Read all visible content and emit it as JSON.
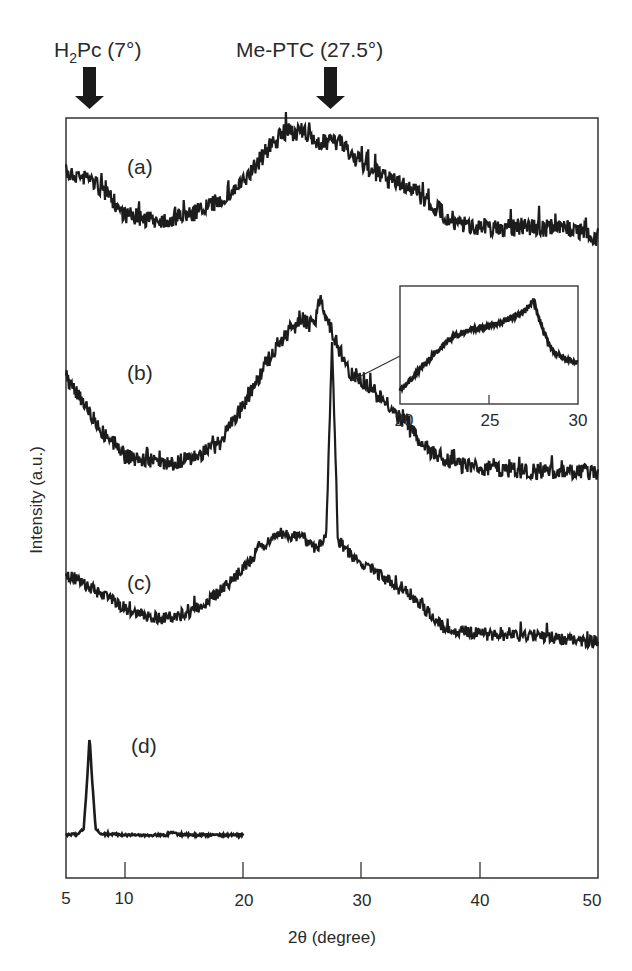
{
  "chart_data": {
    "type": "line",
    "title": "",
    "xlabel": "2θ (degree)",
    "ylabel": "Intensity (a.u.)",
    "xlim": [
      5,
      50
    ],
    "x_ticks": [
      5,
      10,
      20,
      30,
      40,
      50
    ],
    "y_ticks": [],
    "grid": false,
    "legend": "none",
    "annotations": [
      {
        "text": "H2Pc (7°)",
        "x": 7,
        "marker": "down-arrow"
      },
      {
        "text": "Me-PTC (27.5°)",
        "x": 27.5,
        "marker": "down-arrow"
      }
    ],
    "series": [
      {
        "name": "(a)",
        "x": [
          5,
          7,
          9,
          10,
          12,
          14,
          16,
          18,
          20,
          22,
          23.5,
          25,
          26,
          27,
          28,
          30,
          32,
          34,
          36,
          38,
          40,
          42,
          44,
          46,
          48,
          50
        ],
        "values": [
          0.42,
          0.4,
          0.3,
          0.24,
          0.22,
          0.22,
          0.25,
          0.3,
          0.38,
          0.52,
          0.6,
          0.6,
          0.56,
          0.55,
          0.56,
          0.46,
          0.4,
          0.36,
          0.28,
          0.2,
          0.19,
          0.18,
          0.19,
          0.18,
          0.18,
          0.14
        ],
        "note": "broad amorphous hump centered ~24°"
      },
      {
        "name": "(b)",
        "x": [
          5,
          6,
          8,
          10,
          12,
          14,
          16,
          18,
          20,
          22,
          24,
          25,
          26,
          26.5,
          27,
          28,
          29,
          30,
          32,
          34,
          36,
          38,
          40,
          42,
          44,
          46,
          48,
          50
        ],
        "values": [
          0.55,
          0.5,
          0.35,
          0.25,
          0.23,
          0.22,
          0.25,
          0.3,
          0.45,
          0.62,
          0.75,
          0.78,
          0.76,
          0.88,
          0.8,
          0.68,
          0.58,
          0.55,
          0.46,
          0.36,
          0.26,
          0.22,
          0.2,
          0.2,
          0.19,
          0.19,
          0.19,
          0.18
        ],
        "note": "broad hump with weak shoulder/peak ~27°"
      },
      {
        "name": "(c)",
        "x": [
          5,
          7,
          9,
          11,
          13,
          15,
          17,
          19,
          21,
          23,
          25,
          26,
          27,
          27.5,
          28,
          29,
          31,
          33,
          35,
          37,
          39,
          41,
          43,
          45,
          47,
          50
        ],
        "values": [
          0.32,
          0.28,
          0.24,
          0.2,
          0.19,
          0.2,
          0.24,
          0.3,
          0.38,
          0.44,
          0.43,
          0.4,
          0.42,
          1.0,
          0.42,
          0.38,
          0.33,
          0.28,
          0.23,
          0.16,
          0.15,
          0.14,
          0.14,
          0.14,
          0.13,
          0.12
        ],
        "note": "broad hump with sharp Me-PTC peak at 27.5°"
      },
      {
        "name": "(d)",
        "x": [
          5,
          6,
          6.5,
          6.8,
          7,
          7.2,
          7.5,
          8,
          10,
          12,
          13.5,
          14,
          14.5,
          16,
          18,
          20
        ],
        "values": [
          0.02,
          0.03,
          0.08,
          0.6,
          1.0,
          0.6,
          0.08,
          0.03,
          0.02,
          0.02,
          0.02,
          0.05,
          0.02,
          0.02,
          0.02,
          0.02
        ],
        "note": "sharp H2Pc peak at 7°, small peak ~14°, data only to 20°"
      }
    ],
    "inset": {
      "type": "line",
      "series_of": "(b)",
      "xlim": [
        20,
        30
      ],
      "x_ticks": [
        20,
        25,
        30
      ],
      "x": [
        20,
        21,
        22,
        23,
        24,
        25,
        26,
        27,
        27.5,
        28,
        28.5,
        29,
        30
      ],
      "values": [
        0.08,
        0.25,
        0.42,
        0.56,
        0.62,
        0.65,
        0.7,
        0.78,
        0.88,
        0.62,
        0.45,
        0.38,
        0.32
      ]
    }
  },
  "labels": {
    "annot_h2pc_main": "H",
    "annot_h2pc_sub": "2",
    "annot_h2pc_rest": "Pc (7°)",
    "annot_meptc": "Me-PTC (27.5°)",
    "curve_a": "(a)",
    "curve_b": "(b)",
    "curve_c": "(c)",
    "curve_d": "(d)",
    "xlabel": "2θ (degree)",
    "ylabel": "Intensity (a.u.)",
    "xtick_5": "5",
    "xtick_10": "10",
    "xtick_20": "20",
    "xtick_30": "30",
    "xtick_40": "40",
    "xtick_50": "50",
    "inset_tick_20": "20",
    "inset_tick_25": "25",
    "inset_tick_30": "30"
  }
}
